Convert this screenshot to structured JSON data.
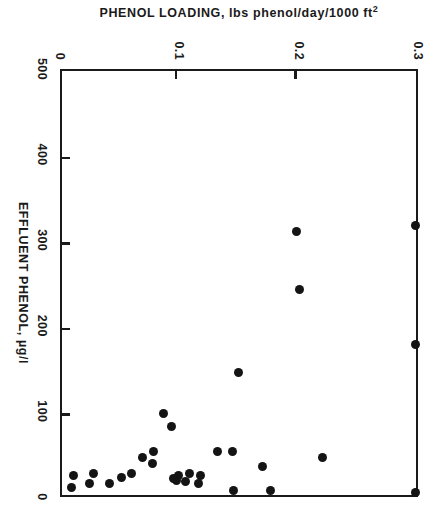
{
  "chart_data": {
    "type": "scatter",
    "title": "",
    "xlabel": "EFFLUENT PHENOL, µg/l",
    "ylabel": "PHENOL LOADING, lbs phenol/day/1000 ft²",
    "ylabel_parts": {
      "main": "PHENOL LOADING, lbs phenol/day/1000 ft",
      "exponent": "2"
    },
    "xlim": [
      0,
      500
    ],
    "ylim": [
      0,
      0.3
    ],
    "x_reversed": true,
    "xticks": [
      500,
      400,
      300,
      200,
      100,
      0
    ],
    "xtick_labels": [
      "500",
      "400",
      "300",
      "200",
      "100",
      "0"
    ],
    "yticks": [
      0,
      0.1,
      0.2,
      0.3
    ],
    "ytick_labels": [
      "0",
      "0.1",
      "0.2",
      "0.3"
    ],
    "grid": false,
    "legend": false,
    "marker": "filled-circle",
    "marker_color": "#141414",
    "frame_color": "#1a1a1a",
    "n_points": 31,
    "points": [
      {
        "effluent_phenol": 320,
        "phenol_loading": 0.3
      },
      {
        "effluent_phenol": 180,
        "phenol_loading": 0.3
      },
      {
        "effluent_phenol": 8,
        "phenol_loading": 0.3
      },
      {
        "effluent_phenol": 48,
        "phenol_loading": 0.222
      },
      {
        "effluent_phenol": 313,
        "phenol_loading": 0.2
      },
      {
        "effluent_phenol": 245,
        "phenol_loading": 0.202
      },
      {
        "effluent_phenol": 10,
        "phenol_loading": 0.178
      },
      {
        "effluent_phenol": 38,
        "phenol_loading": 0.171
      },
      {
        "effluent_phenol": 148,
        "phenol_loading": 0.151
      },
      {
        "effluent_phenol": 55,
        "phenol_loading": 0.146
      },
      {
        "effluent_phenol": 10,
        "phenol_loading": 0.147
      },
      {
        "effluent_phenol": 55,
        "phenol_loading": 0.134
      },
      {
        "effluent_phenol": 28,
        "phenol_loading": 0.119
      },
      {
        "effluent_phenol": 18,
        "phenol_loading": 0.118
      },
      {
        "effluent_phenol": 30,
        "phenol_loading": 0.11
      },
      {
        "effluent_phenol": 20,
        "phenol_loading": 0.107
      },
      {
        "effluent_phenol": 28,
        "phenol_loading": 0.101
      },
      {
        "effluent_phenol": 22,
        "phenol_loading": 0.099
      },
      {
        "effluent_phenol": 24,
        "phenol_loading": 0.097
      },
      {
        "effluent_phenol": 85,
        "phenol_loading": 0.095
      },
      {
        "effluent_phenol": 100,
        "phenol_loading": 0.088
      },
      {
        "effluent_phenol": 42,
        "phenol_loading": 0.079
      },
      {
        "effluent_phenol": 55,
        "phenol_loading": 0.08
      },
      {
        "effluent_phenol": 48,
        "phenol_loading": 0.071
      },
      {
        "effluent_phenol": 30,
        "phenol_loading": 0.062
      },
      {
        "effluent_phenol": 25,
        "phenol_loading": 0.053
      },
      {
        "effluent_phenol": 18,
        "phenol_loading": 0.043
      },
      {
        "effluent_phenol": 30,
        "phenol_loading": 0.03
      },
      {
        "effluent_phenol": 18,
        "phenol_loading": 0.026
      },
      {
        "effluent_phenol": 28,
        "phenol_loading": 0.013
      },
      {
        "effluent_phenol": 13,
        "phenol_loading": 0.011
      }
    ]
  }
}
